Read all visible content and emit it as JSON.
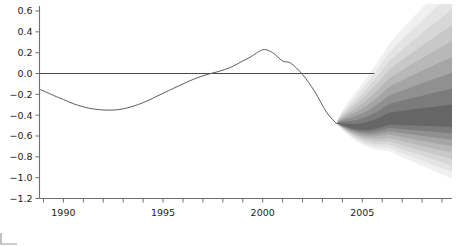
{
  "chart_data": {
    "type": "line",
    "title": "",
    "subtitle": "",
    "xlabel": "",
    "ylabel": "",
    "xlim": [
      1988.8,
      2009.5
    ],
    "ylim": [
      -1.2,
      0.6
    ],
    "grid": false,
    "legend": "none",
    "y_ticks": [
      0.6,
      0.4,
      0.2,
      0.0,
      -0.2,
      -0.4,
      -0.6,
      -0.8,
      -1.0,
      -1.2
    ],
    "y_tick_labels": [
      "0.6",
      "0.4",
      "0.2",
      "0.0",
      "-0.2",
      "-0.4",
      "-0.6",
      "-0.8",
      "-1.0",
      "-1.2"
    ],
    "x_ticks": [
      1989,
      1990,
      1991,
      1992,
      1993,
      1994,
      1995,
      1996,
      1997,
      1998,
      1999,
      2000,
      2001,
      2002,
      2003,
      2004,
      2005,
      2006,
      2007,
      2008,
      2009
    ],
    "x_tick_labels": [
      "1990",
      "1995",
      "2000",
      "2005"
    ],
    "x_tick_label_values": [
      1990,
      1995,
      2000,
      2005
    ],
    "reference_line": {
      "y": 0.0,
      "x_from": 1988.8,
      "x_to": 2005.6
    },
    "series": [
      {
        "name": "historical",
        "x": [
          1988.8,
          1989.5,
          1990.0,
          1990.5,
          1991.0,
          1991.5,
          1992.0,
          1992.6,
          1993.2,
          1994.0,
          1995.0,
          1996.0,
          1996.6,
          1997.2,
          1997.8,
          1998.4,
          1999.0,
          1999.4,
          1999.8,
          2000.1,
          2000.5,
          2001.0,
          2001.4,
          2002.0,
          2002.6,
          2003.2,
          2003.7
        ],
        "y": [
          -0.15,
          -0.21,
          -0.25,
          -0.29,
          -0.32,
          -0.34,
          -0.35,
          -0.35,
          -0.33,
          -0.28,
          -0.19,
          -0.1,
          -0.05,
          -0.01,
          0.02,
          0.06,
          0.12,
          0.16,
          0.21,
          0.23,
          0.2,
          0.12,
          0.1,
          -0.01,
          -0.17,
          -0.37,
          -0.48
        ]
      }
    ],
    "fan": {
      "description": "probability fan / density forecast shading after 2003.7",
      "start_x": 2003.7,
      "end_x": 2009.5,
      "center_y_start": -0.48,
      "center_y_end": -0.45,
      "bands": [
        {
          "level": 0.1,
          "shade": "#666666"
        },
        {
          "level": 0.2,
          "shade": "#7b7b7b"
        },
        {
          "level": 0.3,
          "shade": "#909090"
        },
        {
          "level": 0.4,
          "shade": "#a5a5a5"
        },
        {
          "level": 0.5,
          "shade": "#b8b8b8"
        },
        {
          "level": 0.6,
          "shade": "#c8c8c8"
        },
        {
          "level": 0.7,
          "shade": "#d7d7d7"
        },
        {
          "level": 0.8,
          "shade": "#e4e4e4"
        },
        {
          "level": 0.9,
          "shade": "#f0f0f0"
        }
      ],
      "upper_bound_end": 0.45,
      "lower_bound_end": -1.02
    },
    "colors": {
      "axis": "#6f6f6f",
      "line": "#5d5d5d",
      "zero_line": "#4a4a4a",
      "fan_dark": "#666666",
      "fan_light": "#f0f0f0",
      "background": "#ffffff"
    }
  }
}
